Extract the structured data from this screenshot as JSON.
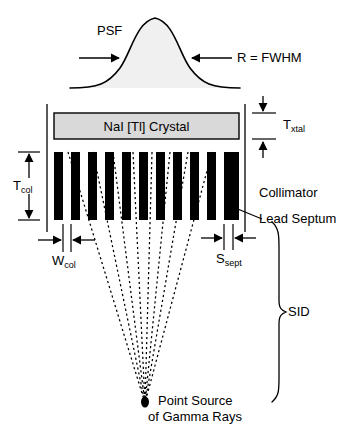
{
  "figure": {
    "background_color": "#ffffff",
    "stroke_color": "#000000",
    "crystal_fill": "#d9d9d9",
    "psf_fill": "#f0f0f0",
    "septa_fill": "#000000"
  },
  "psf": {
    "label": "PSF",
    "fwhm_label_italic": "R",
    "fwhm_label_rest": " = FWHM"
  },
  "crystal": {
    "label": "NaI [Tl] Crystal",
    "thickness_label_main": "T",
    "thickness_label_sub": "xtal"
  },
  "collimator": {
    "label": "Collimator",
    "septum_label": "Lead Septum",
    "thickness_label_main": "T",
    "thickness_label_sub": "col",
    "hole_width_main": "W",
    "hole_width_sub": "col",
    "septal_thickness_main": "S",
    "septal_thickness_sub": "sept",
    "septa_count": 12
  },
  "source": {
    "label_line1": "Point Source",
    "label_line2": "of Gamma Rays",
    "ray_count": 8
  },
  "sid": {
    "label": "SID"
  }
}
